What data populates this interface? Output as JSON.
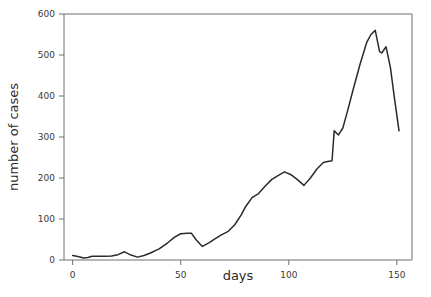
{
  "chart_data": {
    "type": "line",
    "title": "",
    "xlabel": "days",
    "ylabel": "number of cases",
    "xlim": [
      -4,
      157
    ],
    "ylim": [
      0,
      600
    ],
    "grid": false,
    "legend": false,
    "legend_position": "none",
    "line_color": "#2a2a2a",
    "axis_color": "#6e6e6e",
    "xticks": [
      0,
      50,
      100,
      150
    ],
    "xtick_labels": [
      "0",
      "50",
      "100",
      "150"
    ],
    "yticks": [
      0,
      100,
      200,
      300,
      400,
      500,
      600
    ],
    "ytick_labels": [
      "0",
      "100",
      "200",
      "300",
      "400",
      "500",
      "600"
    ],
    "series": [
      {
        "name": "cases",
        "x": [
          0,
          3,
          5,
          7,
          9,
          12,
          15,
          18,
          21,
          24,
          27,
          30,
          33,
          36,
          40,
          44,
          47,
          50,
          53,
          55,
          57,
          60,
          63,
          66,
          69,
          72,
          75,
          78,
          80,
          83,
          86,
          89,
          92,
          95,
          98,
          101,
          104,
          107,
          110,
          113,
          116,
          118,
          120,
          121,
          123,
          125,
          127,
          130,
          133,
          136,
          138,
          140,
          142,
          143,
          145,
          147,
          149,
          151
        ],
        "y": [
          11,
          8,
          5,
          6,
          9,
          9,
          9,
          10,
          13,
          20,
          12,
          7,
          11,
          17,
          27,
          42,
          55,
          64,
          65,
          65,
          50,
          33,
          42,
          52,
          62,
          70,
          86,
          110,
          130,
          152,
          162,
          180,
          196,
          206,
          215,
          208,
          196,
          182,
          200,
          222,
          238,
          240,
          242,
          315,
          305,
          322,
          360,
          420,
          478,
          530,
          550,
          560,
          508,
          505,
          520,
          470,
          390,
          315
        ]
      }
    ]
  },
  "axes": {
    "x_title": "days",
    "y_title": "number of cases"
  }
}
